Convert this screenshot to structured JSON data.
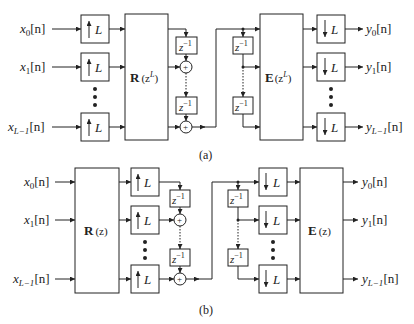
{
  "diagram_a": {
    "caption": "(a)",
    "inputs": [
      "x",
      "x",
      "x"
    ],
    "input_subs": [
      "0",
      "1",
      "L−1"
    ],
    "input_suffix": "[n]",
    "outputs": [
      "y",
      "y",
      "y"
    ],
    "output_subs": [
      "0",
      "1",
      "L−1"
    ],
    "output_suffix": "[n]",
    "upsampler_label": "L",
    "downsampler_label": "L",
    "polyphase_r": {
      "bold": "R",
      "arg": "(z",
      "sup": "L",
      "close": ")"
    },
    "polyphase_e": {
      "bold": "E",
      "arg": "(z",
      "sup": "L",
      "close": ")"
    },
    "delay_label": {
      "base": "z",
      "sup": "−1"
    },
    "adder_symbol": "+"
  },
  "diagram_b": {
    "caption": "(b)",
    "inputs": [
      "x",
      "x",
      "x"
    ],
    "input_subs": [
      "0",
      "1",
      "L−1"
    ],
    "input_suffix": "[n]",
    "outputs": [
      "y",
      "y",
      "y"
    ],
    "output_subs": [
      "0",
      "1",
      "L−1"
    ],
    "output_suffix": "[n]",
    "upsampler_label": "L",
    "downsampler_label": "L",
    "polyphase_r": {
      "bold": "R",
      "arg": "(z)"
    },
    "polyphase_e": {
      "bold": "E",
      "arg": "(z)"
    },
    "delay_label": {
      "base": "z",
      "sup": "−1"
    },
    "adder_symbol": "+"
  }
}
